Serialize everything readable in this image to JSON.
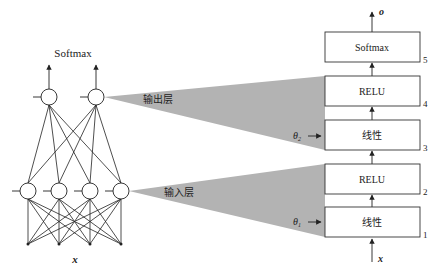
{
  "network": {
    "output_label": "Softmax",
    "input_label": "x",
    "output_nodes": 2,
    "hidden_nodes": 4,
    "input_points": 4
  },
  "callouts": {
    "output_layer": "输出层",
    "input_layer": "输入层"
  },
  "stack": {
    "output_symbol": "o",
    "input_symbol": "x",
    "theta_top": "θ",
    "theta_top_sub": "2",
    "theta_bottom": "θ",
    "theta_bottom_sub": "1",
    "blocks": [
      {
        "label": "Softmax",
        "index": "5"
      },
      {
        "label": "RELU",
        "index": "4"
      },
      {
        "label": "线性",
        "index": "3"
      },
      {
        "label": "RELU",
        "index": "2"
      },
      {
        "label": "线性",
        "index": "1"
      }
    ]
  },
  "colors": {
    "line": "#222222",
    "wedge": "#b3b3b3",
    "box_border": "#333333",
    "text": "#222222"
  }
}
